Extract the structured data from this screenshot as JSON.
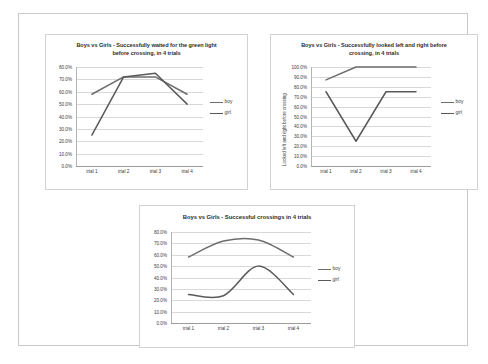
{
  "page": {
    "background": "#ffffff",
    "frame_border_color": "#c9c9c9"
  },
  "colors": {
    "boy_line": "#6e6e6e",
    "girl_line": "#595959",
    "gridline": "#d8d8d8",
    "axis": "#9c9c9c",
    "title_text": "#2e2e2e",
    "tick_text": "#3c3c3c"
  },
  "charts": [
    {
      "id": "chart-1",
      "title": "Boys vs Girls - Successfully waited for the green light before crossing, in 4 trials",
      "title_line_1": "Boys vs Girls - Successfully waited for the green light",
      "title_line_2": "before crossing, in 4 trials",
      "y_axis_title": "",
      "y_ticks": [
        "80.0%",
        "70.0%",
        "60.0%",
        "50.0%",
        "40.0%",
        "30.0%",
        "20.0%",
        "10.0%",
        "0.0%"
      ],
      "x_ticks": [
        "trial 1",
        "trial 2",
        "trial 3",
        "trial 4"
      ],
      "legend": [
        "boy",
        "girl"
      ],
      "chart_data": {
        "type": "line",
        "title": "Boys vs Girls - Successfully waited for the green light before crossing, in 4 trials",
        "categories": [
          "trial 1",
          "trial 2",
          "trial 3",
          "trial 4"
        ],
        "series": [
          {
            "name": "boy",
            "values": [
              58.0,
              72.0,
              72.0,
              58.0
            ]
          },
          {
            "name": "girl",
            "values": [
              25.0,
              72.0,
              75.0,
              50.0
            ]
          }
        ],
        "xlabel": "",
        "ylabel": "",
        "ylim": [
          0,
          80
        ],
        "ytick_step": 10,
        "grid": true,
        "legend_position": "right",
        "smooth": false
      }
    },
    {
      "id": "chart-2",
      "title": "Boys vs Girls - Successfully looked left and right before crossing, in 4 trials",
      "title_line_1": "Boys vs Girls - Successfully looked left and right before",
      "title_line_2": "crossing, in 4 trials",
      "y_axis_title": "Looked left and right before crossing",
      "y_ticks": [
        "100.0%",
        "90.0%",
        "80.0%",
        "70.0%",
        "60.0%",
        "50.0%",
        "40.0%",
        "30.0%",
        "20.0%",
        "10.0%",
        "0.0%"
      ],
      "x_ticks": [
        "trial 1",
        "trial 2",
        "trial 3",
        "trial 4"
      ],
      "legend": [
        "boy",
        "girl"
      ],
      "chart_data": {
        "type": "line",
        "title": "Boys vs Girls - Successfully looked left and right before crossing, in 4 trials",
        "categories": [
          "trial 1",
          "trial 2",
          "trial 3",
          "trial 4"
        ],
        "series": [
          {
            "name": "boy",
            "values": [
              87.0,
              100.0,
              100.0,
              100.0
            ]
          },
          {
            "name": "girl",
            "values": [
              75.0,
              25.0,
              75.0,
              75.0
            ]
          }
        ],
        "xlabel": "",
        "ylabel": "Looked left and right before crossing",
        "ylim": [
          0,
          100
        ],
        "ytick_step": 10,
        "grid": true,
        "legend_position": "right",
        "smooth": false
      }
    },
    {
      "id": "chart-3",
      "title": "Boys vs Girls - Successful crossings in 4 trials",
      "title_line_1": "Boys vs Girls - Successful crossings in 4 trials",
      "title_line_2": "",
      "y_axis_title": "",
      "y_ticks": [
        "80.0%",
        "70.0%",
        "60.0%",
        "50.0%",
        "40.0%",
        "30.0%",
        "20.0%",
        "10.0%",
        "0.0%"
      ],
      "x_ticks": [
        "trial 1",
        "trial 2",
        "trial 3",
        "trial 4"
      ],
      "legend": [
        "boy",
        "girl"
      ],
      "chart_data": {
        "type": "line",
        "title": "Boys vs Girls - Successful crossings in 4 trials",
        "categories": [
          "trial 1",
          "trial 2",
          "trial 3",
          "trial 4"
        ],
        "series": [
          {
            "name": "boy",
            "values": [
              58.0,
              72.0,
              73.0,
              58.0
            ]
          },
          {
            "name": "girl",
            "values": [
              25.0,
              24.0,
              50.0,
              25.0
            ]
          }
        ],
        "xlabel": "",
        "ylabel": "",
        "ylim": [
          0,
          80
        ],
        "ytick_step": 10,
        "grid": true,
        "legend_position": "right",
        "smooth": true
      }
    }
  ]
}
